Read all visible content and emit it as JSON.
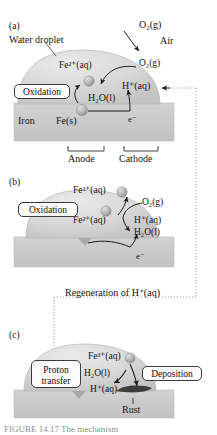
{
  "figure": {
    "title_tag": "rusting-mechanism-diagram",
    "caption": "FIGURE 14.17  The mechanism",
    "colors": {
      "droplet": "#d4d4d4",
      "droplet_edge": "#b6b6b6",
      "metal": "#c9c9c9",
      "metal_edge": "#bdbdbd",
      "ion_sphere": "#b0b0b0",
      "rust": "#3d3d3d",
      "arrow": "#1a1a1a",
      "dotted": "#9a9a9a",
      "callout_border": "#3b3b3b"
    }
  },
  "panel_a": {
    "tag": "(a)",
    "droplet_label": "Water droplet",
    "metal_label": "Iron",
    "callout_oxidation": "Oxidation",
    "species": {
      "o2_air": "O₂(g)",
      "air": "Air",
      "o2_dissolved": "O₂(g)",
      "fe2": "Fe²⁺(aq)",
      "h2o": "H₂O(l)",
      "h_plus": "H⁺(aq)",
      "fe_s": "Fe(s)",
      "electron": "e⁻"
    },
    "brackets": {
      "anode": "Anode",
      "cathode": "Cathode"
    }
  },
  "panel_b": {
    "tag": "(b)",
    "callout_oxidation": "Oxidation",
    "species": {
      "fe3": "Fe³⁺(aq)",
      "fe2": "Fe²⁺(aq)",
      "o2": "O₂(g)",
      "h_plus": "H⁺(aq)",
      "h2o": "H₂O(l)",
      "electron": "e⁻"
    }
  },
  "link": {
    "regeneration_label": "Regeneration of H⁺(aq)"
  },
  "panel_c": {
    "tag": "(c)",
    "callout_proton_transfer_line1": "Proton",
    "callout_proton_transfer_line2": "transfer",
    "callout_deposition": "Deposition",
    "species": {
      "fe3": "Fe³⁺(aq)",
      "h2o": "H₂O(l)",
      "h_plus": "H⁺(aq)"
    },
    "rust_label": "Rust"
  }
}
